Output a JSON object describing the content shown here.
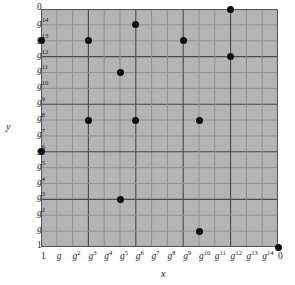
{
  "figure": {
    "kind": "discrete-logarithm-scatter-plot",
    "background": "#ffffff",
    "plot_fill": "#b4b4b4",
    "point_color": "#0d0d0d",
    "grid_minor_color": "#8f8f8f",
    "grid_major_color": "#4a4a4a"
  },
  "axes": {
    "x_label": "x",
    "y_label": "y",
    "x_ticks": [
      {
        "base": "1",
        "exp": ""
      },
      {
        "base": "g",
        "exp": ""
      },
      {
        "base": "g",
        "exp": "2"
      },
      {
        "base": "g",
        "exp": "3"
      },
      {
        "base": "g",
        "exp": "4"
      },
      {
        "base": "g",
        "exp": "5"
      },
      {
        "base": "g",
        "exp": "6"
      },
      {
        "base": "g",
        "exp": "7"
      },
      {
        "base": "g",
        "exp": "8"
      },
      {
        "base": "g",
        "exp": "9"
      },
      {
        "base": "g",
        "exp": "10"
      },
      {
        "base": "g",
        "exp": "11"
      },
      {
        "base": "g",
        "exp": "12"
      },
      {
        "base": "g",
        "exp": "13"
      },
      {
        "base": "g",
        "exp": "14"
      },
      {
        "base": "0",
        "exp": ""
      }
    ],
    "y_ticks": [
      {
        "base": "0",
        "exp": ""
      },
      {
        "base": "g",
        "exp": "14"
      },
      {
        "base": "g",
        "exp": "13"
      },
      {
        "base": "g",
        "exp": "12"
      },
      {
        "base": "g",
        "exp": "11"
      },
      {
        "base": "g",
        "exp": "10"
      },
      {
        "base": "g",
        "exp": "9"
      },
      {
        "base": "g",
        "exp": "8"
      },
      {
        "base": "g",
        "exp": "7"
      },
      {
        "base": "g",
        "exp": "6"
      },
      {
        "base": "g",
        "exp": "5"
      },
      {
        "base": "g",
        "exp": "4"
      },
      {
        "base": "g",
        "exp": "3"
      },
      {
        "base": "g",
        "exp": "2"
      },
      {
        "base": "g",
        "exp": ""
      },
      {
        "base": "1",
        "exp": ""
      }
    ]
  },
  "chart_data": {
    "type": "scatter",
    "title": "",
    "subtitle": "",
    "xlabel": "x",
    "ylabel": "y",
    "grid": true,
    "legend": null,
    "x_categories": [
      "1",
      "g",
      "g^2",
      "g^3",
      "g^4",
      "g^5",
      "g^6",
      "g^7",
      "g^8",
      "g^9",
      "g^10",
      "g^11",
      "g^12",
      "g^13",
      "g^14",
      "0"
    ],
    "y_categories": [
      "0",
      "g^14",
      "g^13",
      "g^12",
      "g^11",
      "g^10",
      "g^9",
      "g^8",
      "g^7",
      "g^6",
      "g^5",
      "g^4",
      "g^3",
      "g^2",
      "g",
      "1"
    ],
    "x_index_range": [
      0,
      15
    ],
    "y_index_range": [
      0,
      15
    ],
    "note": "x index counts columns from left (0..15); y index counts rows from top (0..15)",
    "points": [
      {
        "xi": 12,
        "yi": 0,
        "x": "g^12",
        "y": "0"
      },
      {
        "xi": 6,
        "yi": 1,
        "x": "g^6",
        "y": "g^14"
      },
      {
        "xi": 0,
        "yi": 2,
        "x": "1",
        "y": "g^13"
      },
      {
        "xi": 3,
        "yi": 2,
        "x": "g^3",
        "y": "g^13"
      },
      {
        "xi": 9,
        "yi": 2,
        "x": "g^9",
        "y": "g^13"
      },
      {
        "xi": 12,
        "yi": 3,
        "x": "g^12",
        "y": "g^12"
      },
      {
        "xi": 5,
        "yi": 4,
        "x": "g^5",
        "y": "g^11"
      },
      {
        "xi": 3,
        "yi": 7,
        "x": "g^3",
        "y": "g^8"
      },
      {
        "xi": 6,
        "yi": 7,
        "x": "g^6",
        "y": "g^8"
      },
      {
        "xi": 10,
        "yi": 7,
        "x": "g^10",
        "y": "g^8"
      },
      {
        "xi": 0,
        "yi": 9,
        "x": "1",
        "y": "g^6"
      },
      {
        "xi": 5,
        "yi": 12,
        "x": "g^5",
        "y": "g^3"
      },
      {
        "xi": 10,
        "yi": 14,
        "x": "g^10",
        "y": "g"
      },
      {
        "xi": 15,
        "yi": 15,
        "x": "0",
        "y": "1"
      }
    ]
  }
}
